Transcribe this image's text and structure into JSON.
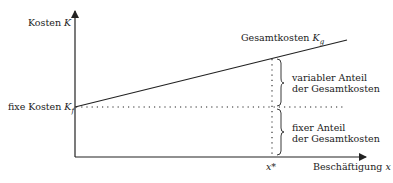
{
  "diagram": {
    "type": "cost-function",
    "colors": {
      "line": "#222222",
      "background": "#ffffff"
    },
    "y_axis": {
      "label": "Kosten ",
      "var": "K"
    },
    "x_axis": {
      "label": "Beschäftigung ",
      "var": "x"
    },
    "fixed_cost": {
      "label": "fixe Kosten ",
      "var": "K",
      "sub": "f"
    },
    "total_cost": {
      "label": "Gesamtkosten ",
      "var": "K",
      "sub": "g"
    },
    "marker": {
      "label": "x*"
    },
    "brace_variable": {
      "line1": "variabler Anteil",
      "line2": "der Gesamtkosten"
    },
    "brace_fixed": {
      "line1": "fixer Anteil",
      "line2": "der Gesamtkosten"
    }
  }
}
